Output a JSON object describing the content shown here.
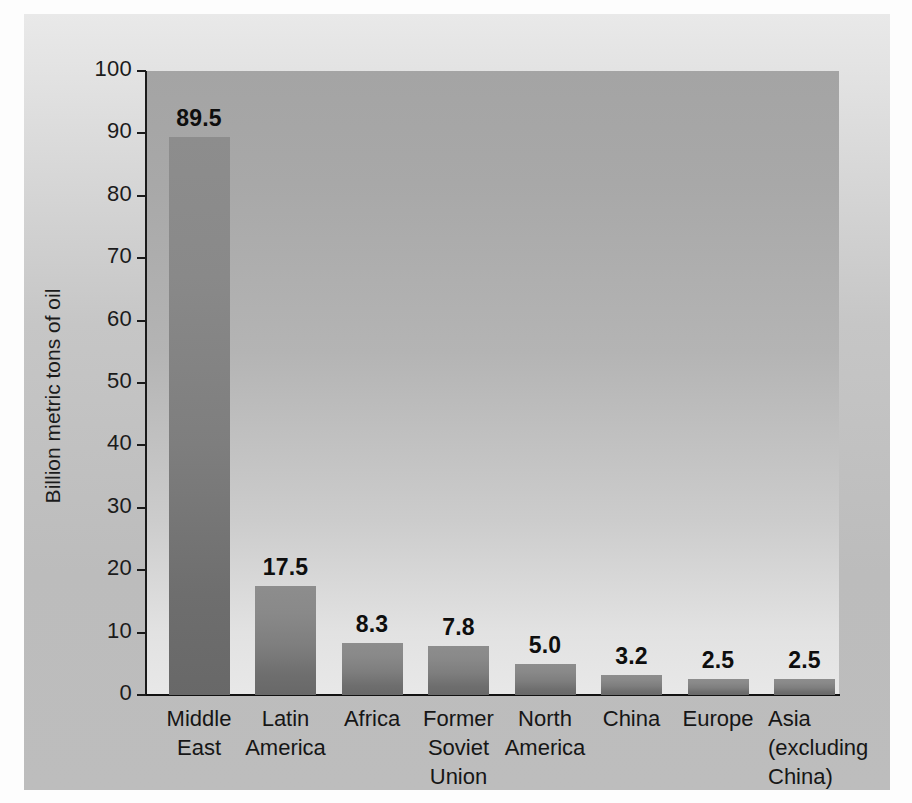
{
  "chart_data": {
    "type": "bar",
    "title": "",
    "subtitle": "",
    "xlabel": "",
    "ylabel": "Billion metric tons of oil",
    "ylim": [
      0,
      100
    ],
    "yticks": [
      0,
      10,
      20,
      30,
      40,
      50,
      60,
      70,
      80,
      90,
      100
    ],
    "grid": false,
    "legend": "none",
    "categories": [
      "Middle\nEast",
      "Latin\nAmerica",
      "Africa",
      "Former\nSoviet\nUnion",
      "North\nAmerica",
      "China",
      "Europe",
      "Asia\n(excluding\nChina)"
    ],
    "values": [
      89.5,
      17.5,
      8.3,
      7.8,
      5.0,
      3.2,
      2.5,
      2.5
    ],
    "value_labels": [
      "89.5",
      "17.5",
      "8.3",
      "7.8",
      "5.0",
      "3.2",
      "2.5",
      "2.5"
    ],
    "tick_labels": [
      "100",
      "90",
      "80",
      "70",
      "60",
      "50",
      "40",
      "30",
      "20",
      "10",
      "0"
    ]
  },
  "colors": {
    "bar": "#7e7e7e",
    "plot_background_top": "#a4a4a4",
    "plot_background_bottom": "#e8e8e8",
    "card_background": "#c6c6c6",
    "axis": "#1a1a1a",
    "text": "#161616"
  }
}
